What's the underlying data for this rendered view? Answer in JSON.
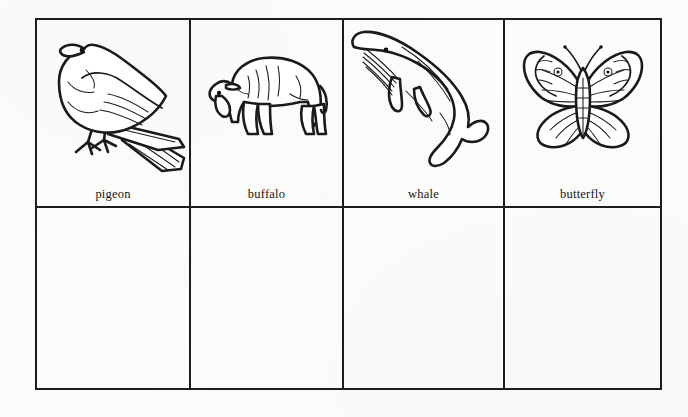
{
  "worksheet": {
    "title": "Animal picture word cards",
    "background_color": "#fcfcfa",
    "ink_color": "#1a1a1a",
    "columns": 4,
    "rows": 2
  },
  "grid": {
    "top_row": [
      {
        "label": "pigeon",
        "icon": "pigeon-illustration",
        "animal_group": "bird"
      },
      {
        "label": "buffalo",
        "icon": "buffalo-illustration",
        "animal_group": "mammal"
      },
      {
        "label": "whale",
        "icon": "whale-illustration",
        "animal_group": "mammal"
      },
      {
        "label": "butterfly",
        "icon": "butterfly-illustration",
        "animal_group": "insect"
      }
    ],
    "bottom_row": [
      {
        "label": ""
      },
      {
        "label": ""
      },
      {
        "label": ""
      },
      {
        "label": ""
      }
    ]
  }
}
